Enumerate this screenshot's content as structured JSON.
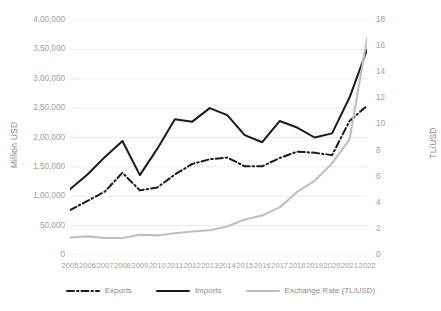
{
  "chart_data": {
    "type": "line",
    "title": "",
    "xlabel": "",
    "ylabel": "Million USD",
    "y2label": "TL/USD",
    "grid": true,
    "legend_position": "bottom",
    "categories": [
      "2005",
      "2006",
      "2007",
      "2008",
      "2009",
      "2010",
      "2011",
      "2012",
      "2013",
      "2014",
      "2015",
      "2016",
      "2017",
      "2018",
      "2019",
      "2020",
      "2021",
      "2022"
    ],
    "ylim": [
      0,
      400000
    ],
    "yticks": [
      0,
      50000,
      100000,
      150000,
      200000,
      250000,
      300000,
      350000,
      400000
    ],
    "ytick_labels": [
      "0",
      "50,000",
      "1,00,000",
      "1,50,000",
      "2,00,000",
      "2,50,000",
      "3,00,000",
      "3,50,000",
      "4,00,000"
    ],
    "y2lim": [
      0,
      18
    ],
    "y2ticks": [
      0,
      2,
      4,
      6,
      8,
      10,
      12,
      14,
      16,
      18
    ],
    "y2tick_labels": [
      "0",
      "2",
      "4",
      "6",
      "8",
      "10",
      "12",
      "14",
      "16",
      "18"
    ],
    "series": [
      {
        "name": "Exports",
        "axis": "left",
        "style": "dash-dot",
        "color": "#1a1a1a",
        "values": [
          76500,
          92000,
          108000,
          140000,
          110000,
          115000,
          137000,
          155000,
          163000,
          166000,
          151000,
          151000,
          165000,
          176000,
          174000,
          170000,
          228000,
          254000
        ]
      },
      {
        "name": "Imports",
        "axis": "left",
        "style": "solid",
        "color": "#1a1a1a",
        "values": [
          112000,
          137000,
          167000,
          194000,
          136000,
          181000,
          231000,
          227000,
          250000,
          238000,
          204000,
          192000,
          228000,
          217000,
          200000,
          207000,
          268000,
          349000
        ]
      },
      {
        "name": "Exchange Rate (TL/USD)",
        "axis": "right",
        "style": "solid",
        "color": "#bfbfbf",
        "values": [
          1.34,
          1.43,
          1.3,
          1.3,
          1.55,
          1.5,
          1.67,
          1.8,
          1.9,
          2.19,
          2.72,
          3.02,
          3.65,
          4.83,
          5.68,
          7.01,
          8.85,
          16.55
        ]
      }
    ]
  },
  "legend": {
    "items": [
      {
        "label": "Exports",
        "style": "dash-dot",
        "color": "#1a1a1a"
      },
      {
        "label": "Imports",
        "style": "solid",
        "color": "#1a1a1a"
      },
      {
        "label": "Exchange Rate (TL/USD)",
        "style": "solid",
        "color": "#bfbfbf"
      }
    ]
  }
}
